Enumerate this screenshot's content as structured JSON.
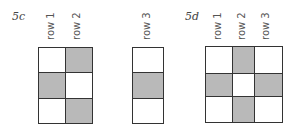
{
  "figures": [
    {
      "id": "5c",
      "label": "5c",
      "grids": [
        {
          "column_labels": [
            "row 1",
            "row 2"
          ],
          "cells": [
            [
              0,
              1
            ],
            [
              1,
              0
            ],
            [
              0,
              1
            ]
          ]
        },
        {
          "column_labels": [
            "row 3"
          ],
          "cells": [
            [
              0
            ],
            [
              1
            ],
            [
              0
            ]
          ]
        }
      ]
    },
    {
      "id": "5d",
      "label": "5d",
      "grids": [
        {
          "column_labels": [
            "row 1",
            "row 2",
            "row 3"
          ],
          "cells": [
            [
              0,
              1,
              0
            ],
            [
              1,
              0,
              1
            ],
            [
              0,
              1,
              0
            ]
          ]
        }
      ]
    }
  ],
  "colors": {
    "filled": "#b9b9b9",
    "empty": "#ffffff",
    "line": "#333333"
  }
}
